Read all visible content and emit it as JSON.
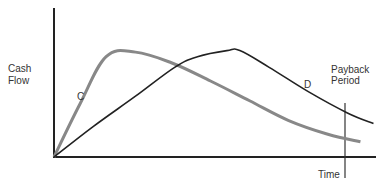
{
  "chart_data": {
    "type": "line",
    "title": "",
    "ylabel": [
      "Cash",
      "Flow"
    ],
    "xlabel": "Time",
    "annotation": [
      "Payback",
      "Period"
    ],
    "x_range": [
      0,
      100
    ],
    "y_range": [
      0,
      100
    ],
    "payback_x": 91,
    "series": [
      {
        "name": "C",
        "color": "#888888",
        "points": [
          [
            0,
            0
          ],
          [
            8,
            35
          ],
          [
            16,
            66
          ],
          [
            25,
            69
          ],
          [
            36,
            62
          ],
          [
            48,
            50
          ],
          [
            60,
            37
          ],
          [
            72,
            24
          ],
          [
            84,
            15
          ],
          [
            94,
            10
          ]
        ]
      },
      {
        "name": "D",
        "color": "#222222",
        "points": [
          [
            0,
            0
          ],
          [
            12,
            20
          ],
          [
            25,
            40
          ],
          [
            37,
            59
          ],
          [
            44,
            66
          ],
          [
            53,
            70
          ],
          [
            57,
            70
          ],
          [
            66,
            59
          ],
          [
            78,
            43
          ],
          [
            90,
            29
          ],
          [
            98,
            22
          ]
        ]
      }
    ],
    "grid": false,
    "legend": "none"
  }
}
